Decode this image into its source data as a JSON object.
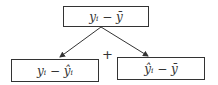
{
  "nodes": {
    "top": {
      "label": "yᵢ − ȳ"
    },
    "left": {
      "label": "yᵢ − ŷᵢ"
    },
    "right": {
      "label": "ŷᵢ − ȳ"
    }
  },
  "operator": "+"
}
